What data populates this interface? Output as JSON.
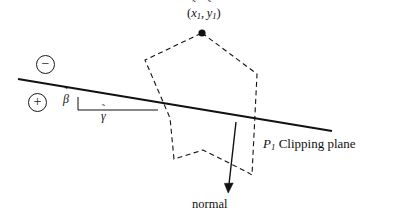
{
  "figure": {
    "stroke_color": "#111111",
    "background_color": "#ffffff"
  },
  "labels": {
    "vertex_point": {
      "text": "(x̃₁ , ỹ₁)",
      "open_paren": "(",
      "x_symbol": "x",
      "x_accent": "˜",
      "x_subscript": "1",
      "separator": ",",
      "y_symbol": "y",
      "y_accent": "˜",
      "y_subscript": "1",
      "close_paren": ")"
    },
    "clipping_plane": {
      "symbol": "P",
      "subscript": "1",
      "text": "Clipping plane"
    },
    "normal": {
      "text": "normal"
    },
    "beta": {
      "symbol": "β",
      "accent": "˜",
      "text": "β̃"
    },
    "gamma": {
      "symbol": "γ",
      "accent": "˜",
      "text": "γ̃"
    },
    "negative_halfspace": {
      "glyph": "−",
      "name": "circled-minus"
    },
    "positive_halfspace": {
      "glyph": "+",
      "name": "circled-plus"
    }
  },
  "geometry": {
    "clipping_plane_line": {
      "x1": 18,
      "y1": 79,
      "x2": 332,
      "y2": 131,
      "stroke_width": 2.2
    },
    "angle_triangle": {
      "vertex_x": 78,
      "vertex_y": 97,
      "corner_x": 158,
      "corner_y": 110,
      "base_x": 78,
      "base_y": 110,
      "stroke_width": 1.0
    },
    "normal_arrow": {
      "x1": 236,
      "y1": 122,
      "x2": 228,
      "y2": 192,
      "stroke_width": 1.4,
      "head_size": 6
    },
    "polygon": {
      "dash_pattern": "5,3.5",
      "stroke_width": 1.1,
      "vertices": [
        {
          "x": 202,
          "y": 33
        },
        {
          "x": 257,
          "y": 74
        },
        {
          "x": 252,
          "y": 175
        },
        {
          "x": 247,
          "y": 172
        },
        {
          "x": 203,
          "y": 150
        },
        {
          "x": 174,
          "y": 159
        },
        {
          "x": 170,
          "y": 118
        },
        {
          "x": 145,
          "y": 60
        }
      ]
    },
    "vertex_dot": {
      "cx": 202,
      "cy": 33,
      "r": 3.6
    }
  }
}
